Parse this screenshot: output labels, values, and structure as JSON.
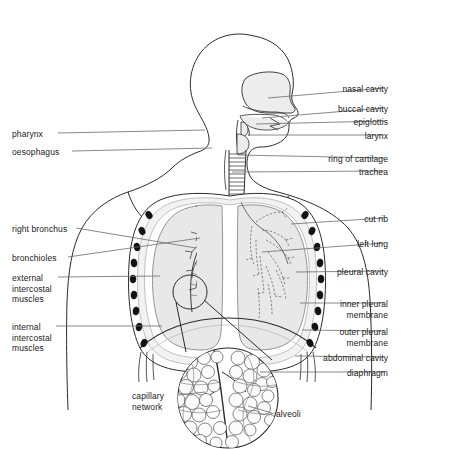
{
  "diagram": {
    "colors": {
      "outline": "#2b2b2b",
      "leader_line": "#6b6b6b",
      "lung_fill": "#e8e8e8",
      "cavity_fill": "#ededed",
      "rib_fill": "#111111",
      "text": "#1a1a1a",
      "background": "#ffffff"
    },
    "labels_right": [
      {
        "id": "nasal-cavity",
        "text": "nasal cavity",
        "x": 388,
        "y": 84,
        "line": [
          384,
          88,
          268,
          98
        ]
      },
      {
        "id": "buccal-cavity",
        "text": "buccal cavity",
        "x": 388,
        "y": 104,
        "line": [
          384,
          108,
          262,
          118
        ]
      },
      {
        "id": "epiglottis",
        "text": "epiglottis",
        "x": 388,
        "y": 117,
        "line": [
          384,
          121,
          256,
          124
        ]
      },
      {
        "id": "larynx",
        "text": "larynx",
        "x": 388,
        "y": 131,
        "line": [
          384,
          135,
          248,
          135
        ]
      },
      {
        "id": "ring-of-cartilage",
        "text": "ring of cartilage",
        "x": 388,
        "y": 154,
        "line": [
          384,
          158,
          238,
          155
        ]
      },
      {
        "id": "trachea",
        "text": "trachea",
        "x": 388,
        "y": 167,
        "line": [
          384,
          171,
          232,
          172
        ]
      },
      {
        "id": "cut-rib",
        "text": "cut rib",
        "x": 388,
        "y": 214,
        "line": [
          384,
          218,
          291,
          224
        ]
      },
      {
        "id": "left-lung",
        "text": "left lung",
        "x": 388,
        "y": 239,
        "line": [
          384,
          243,
          262,
          252
        ]
      },
      {
        "id": "pleural-cavity",
        "text": "pleural cavity",
        "x": 388,
        "y": 267,
        "line": [
          384,
          271,
          296,
          272
        ]
      },
      {
        "id": "inner-pleural-membrane",
        "text": "inner pleural\nmembrane",
        "x": 388,
        "y": 299,
        "line": [
          384,
          303,
          300,
          303
        ]
      },
      {
        "id": "outer-pleural-membrane",
        "text": "outer pleural\nmembrane",
        "x": 388,
        "y": 327,
        "line": [
          384,
          331,
          302,
          330
        ]
      },
      {
        "id": "abdominal-cavity",
        "text": "abdominal cavity",
        "x": 388,
        "y": 353,
        "line": [
          384,
          357,
          295,
          356
        ]
      },
      {
        "id": "diaphragm",
        "text": "diaphragm",
        "x": 388,
        "y": 368,
        "line": [
          384,
          372,
          260,
          372
        ]
      }
    ],
    "labels_left": [
      {
        "id": "pharynx",
        "text": "pharynx",
        "x": 12,
        "y": 129,
        "line": [
          58,
          133,
          205,
          130
        ]
      },
      {
        "id": "oesophagus",
        "text": "oesophagus",
        "x": 12,
        "y": 147,
        "line": [
          72,
          151,
          212,
          148
        ]
      },
      {
        "id": "right-bronchus",
        "text": "right bronchus",
        "x": 12,
        "y": 224,
        "line": [
          76,
          228,
          196,
          248
        ]
      },
      {
        "id": "bronchioles",
        "text": "bronchioles",
        "x": 12,
        "y": 253,
        "line": [
          68,
          257,
          200,
          238
        ]
      },
      {
        "id": "external-intercostal-muscles",
        "text": "external\nintercostal\nmuscles",
        "x": 12,
        "y": 273,
        "line": [
          58,
          277,
          160,
          276
        ]
      },
      {
        "id": "internal-intercostal-muscles",
        "text": "internal\nintercostal\nmuscles",
        "x": 12,
        "y": 322,
        "line": [
          56,
          326,
          162,
          326
        ]
      },
      {
        "id": "capillary-network",
        "text": "capillary\nnetwork",
        "x": 132,
        "y": 391,
        "line": [
          178,
          395,
          205,
          392
        ]
      },
      {
        "id": "alveoli",
        "text": "alveoli",
        "x": 276,
        "y": 409,
        "line": [
          272,
          413,
          248,
          406
        ]
      }
    ]
  }
}
